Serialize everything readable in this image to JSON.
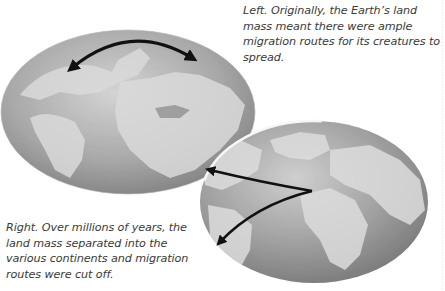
{
  "captions": {
    "left": "Left. Originally, the Earth’s land mass meant there were ample migration routes for its creatures to spread.",
    "right": "Right. Over millions of years, the land mass separated into the various continents and migration routes were cut off."
  },
  "globes": {
    "left": {
      "label": "pangaea-globe",
      "arrow": "double-headed-curved-arrow"
    },
    "right": {
      "label": "modern-earth-globe",
      "arrows": [
        "arrow-to-north-america",
        "arrow-to-south-america"
      ]
    }
  },
  "colors": {
    "ocean_dark": "#8a8a8a",
    "ocean_light": "#c4c4c4",
    "land": "#d8d8d8",
    "arrow": "#111111",
    "text": "#3a3a3a"
  }
}
